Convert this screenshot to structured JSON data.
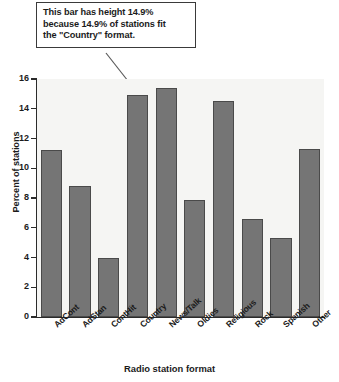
{
  "annotation": {
    "lines": [
      "This bar has height 14.9%",
      "because 14.9% of stations fit",
      "the \"Country\" format."
    ],
    "points_to": "Country"
  },
  "chart_data": {
    "type": "bar",
    "title": "",
    "xlabel": "Radio station format",
    "ylabel": "Percent of stations",
    "categories": [
      "AdCont",
      "AdStan",
      "ContHit",
      "Country",
      "News/Talk",
      "Oldies",
      "Religious",
      "Rock",
      "Spanish",
      "Other"
    ],
    "values": [
      11.2,
      8.8,
      4.0,
      14.9,
      15.4,
      7.9,
      14.5,
      6.6,
      5.3,
      11.3
    ],
    "ylim": [
      0,
      16
    ],
    "yticks": [
      0,
      2,
      4,
      6,
      8,
      10,
      12,
      14,
      16
    ],
    "ytick_labels": [
      "0",
      "2",
      "4",
      "6",
      "8",
      "10",
      "12",
      "14",
      "16"
    ],
    "grid": false,
    "legend": null,
    "bar_color": "#757575",
    "bar_edge_color": "#4a4a4a",
    "plot_background": "#f5f5f3",
    "axis_color": "#2b2b2b"
  }
}
